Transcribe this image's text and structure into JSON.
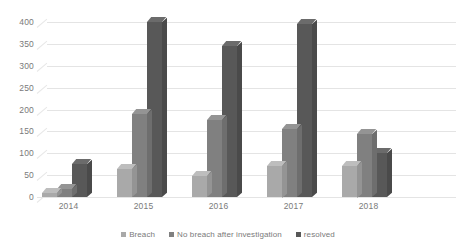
{
  "chart_data": {
    "type": "bar",
    "title": "",
    "subtitle": "",
    "xlabel": "",
    "ylabel": "",
    "categories": [
      "2014",
      "2015",
      "2016",
      "2017",
      "2018"
    ],
    "series": [
      {
        "name": "Breach",
        "color": "#a9a9a9",
        "values": [
          10,
          65,
          48,
          72,
          72
        ]
      },
      {
        "name": "No breach after investigation",
        "color": "#808080",
        "values": [
          18,
          190,
          175,
          155,
          145
        ]
      },
      {
        "name": "resolved",
        "color": "#585858",
        "values": [
          75,
          400,
          345,
          395,
          100
        ]
      }
    ],
    "ylim": [
      0,
      400
    ],
    "yticks": [
      0,
      50,
      100,
      150,
      200,
      250,
      300,
      350,
      400
    ],
    "ytick_labels": [
      "0",
      "50",
      "100",
      "150",
      "200",
      "250",
      "300",
      "350",
      "400"
    ],
    "grid": true,
    "grid_axis": "y",
    "grid_color": "#e4e4e4",
    "legend_position": "bottom",
    "legend_orientation": "horizontal",
    "style": "3d-clustered-column",
    "background": "#ffffff",
    "axis_text_color": "#7a7a7a"
  }
}
